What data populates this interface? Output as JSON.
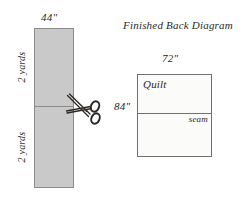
{
  "diagram": {
    "title": "Finished Back Diagram",
    "fabric": {
      "width_label": "44\"",
      "top_length_label": "2 yards",
      "bottom_length_label": "2 yards",
      "cut_tool_icon": "scissors-icon",
      "fill_color": "#c9c9c9",
      "stroke_color": "#8c8c8c"
    },
    "quilt_back": {
      "width_label": "72\"",
      "height_label": "84\"",
      "area_label": "Quilt",
      "seam_label": "seam",
      "fill_color": "#fbfbf9",
      "stroke_color": "#6f6f6f"
    }
  }
}
